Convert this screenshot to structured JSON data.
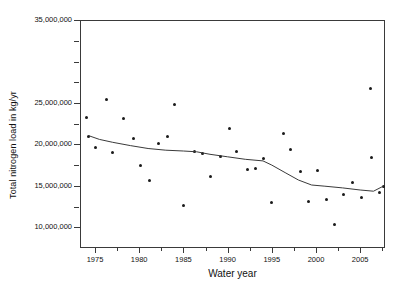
{
  "chart_data": {
    "type": "scatter",
    "title": "",
    "xlabel": "Water year",
    "ylabel": "Total nitrogen load in kg/yr",
    "xlim": [
      1973.3,
      2007.8
    ],
    "ylim": [
      7500000,
      35000000
    ],
    "grid": false,
    "legend": null,
    "x_ticks": [
      1975,
      1980,
      1985,
      1990,
      1995,
      2000,
      2005
    ],
    "x_tick_labels": [
      "1975",
      "1980",
      "1985",
      "1990",
      "1995",
      "2000",
      "2005"
    ],
    "x_minor_ticks": [
      1977.5,
      1982.5,
      1987.5,
      1992.5,
      1997.5,
      2002.5,
      2007.5
    ],
    "y_ticks": [
      10000000,
      12500000,
      15000000,
      17500000,
      20000000,
      22500000,
      25000000,
      27500000,
      30000000,
      32500000,
      35000000
    ],
    "y_tick_labels": [
      "10,000,000",
      "",
      "15,000,000",
      "",
      "20,000,000",
      "",
      "25,000,000",
      "",
      "",
      "",
      "35,000,000"
    ],
    "series": [
      {
        "name": "Annual total nitrogen load",
        "type": "scatter",
        "marker": "filled-circle",
        "color": "#1a1a1a",
        "points": [
          {
            "x": 1974.0,
            "y": 23300000
          },
          {
            "x": 1974.3,
            "y": 21000000
          },
          {
            "x": 1975.0,
            "y": 19600000
          },
          {
            "x": 1976.3,
            "y": 25400000
          },
          {
            "x": 1977.0,
            "y": 19000000
          },
          {
            "x": 1978.2,
            "y": 23150000
          },
          {
            "x": 1979.3,
            "y": 20750000
          },
          {
            "x": 1980.1,
            "y": 17400000
          },
          {
            "x": 1981.1,
            "y": 15600000
          },
          {
            "x": 1982.2,
            "y": 20050000
          },
          {
            "x": 1983.2,
            "y": 20900000
          },
          {
            "x": 1984.0,
            "y": 24800000
          },
          {
            "x": 1985.0,
            "y": 12600000
          },
          {
            "x": 1986.2,
            "y": 19150000
          },
          {
            "x": 1987.1,
            "y": 18900000
          },
          {
            "x": 1988.1,
            "y": 16100000
          },
          {
            "x": 1989.2,
            "y": 18600000
          },
          {
            "x": 1990.2,
            "y": 21950000
          },
          {
            "x": 1991.0,
            "y": 19100000
          },
          {
            "x": 1992.2,
            "y": 17000000
          },
          {
            "x": 1993.1,
            "y": 17150000
          },
          {
            "x": 1994.1,
            "y": 18350000
          },
          {
            "x": 1995.0,
            "y": 13000000
          },
          {
            "x": 1996.3,
            "y": 21300000
          },
          {
            "x": 1997.1,
            "y": 19400000
          },
          {
            "x": 1998.2,
            "y": 16750000
          },
          {
            "x": 1999.1,
            "y": 13150000
          },
          {
            "x": 2000.2,
            "y": 16900000
          },
          {
            "x": 2001.2,
            "y": 13350000
          },
          {
            "x": 2002.1,
            "y": 10400000
          },
          {
            "x": 2003.1,
            "y": 14000000
          },
          {
            "x": 2004.1,
            "y": 15450000
          },
          {
            "x": 2005.1,
            "y": 13600000
          },
          {
            "x": 2006.2,
            "y": 26750000
          },
          {
            "x": 2006.3,
            "y": 18450000
          },
          {
            "x": 2007.2,
            "y": 14250000
          },
          {
            "x": 2007.6,
            "y": 14950000
          }
        ]
      },
      {
        "name": "Smoothed trend line",
        "type": "line",
        "color": "#3a3a3a",
        "points": [
          {
            "x": 1974.3,
            "y": 21050000
          },
          {
            "x": 1975.5,
            "y": 20600000
          },
          {
            "x": 1977.0,
            "y": 20250000
          },
          {
            "x": 1979.0,
            "y": 19850000
          },
          {
            "x": 1981.0,
            "y": 19500000
          },
          {
            "x": 1983.0,
            "y": 19300000
          },
          {
            "x": 1985.0,
            "y": 19200000
          },
          {
            "x": 1986.5,
            "y": 19100000
          },
          {
            "x": 1988.0,
            "y": 18800000
          },
          {
            "x": 1990.0,
            "y": 18500000
          },
          {
            "x": 1992.0,
            "y": 18200000
          },
          {
            "x": 1994.0,
            "y": 18000000
          },
          {
            "x": 1995.0,
            "y": 17500000
          },
          {
            "x": 1996.5,
            "y": 16600000
          },
          {
            "x": 1998.0,
            "y": 15700000
          },
          {
            "x": 1999.5,
            "y": 15100000
          },
          {
            "x": 2001.0,
            "y": 14950000
          },
          {
            "x": 2003.0,
            "y": 14750000
          },
          {
            "x": 2005.0,
            "y": 14500000
          },
          {
            "x": 2006.5,
            "y": 14350000
          },
          {
            "x": 2007.6,
            "y": 14950000
          }
        ]
      }
    ]
  }
}
